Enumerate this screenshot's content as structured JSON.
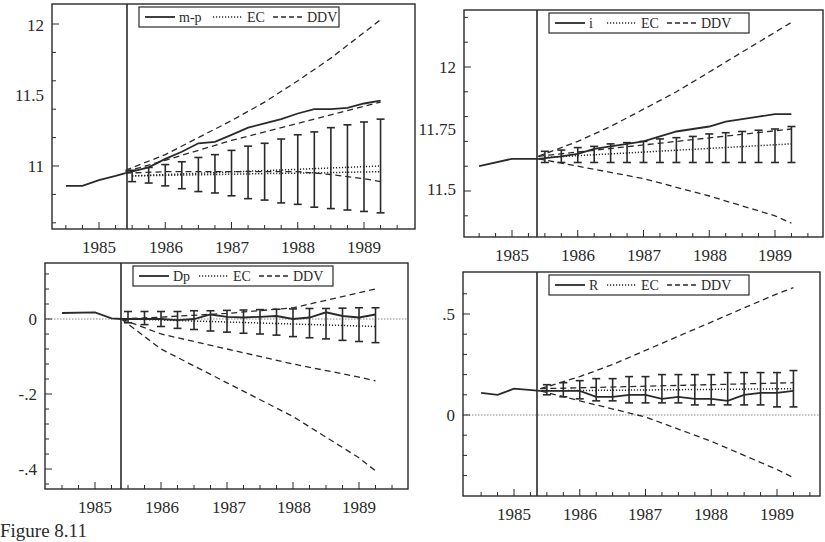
{
  "figure": {
    "caption": "Figure 8.11"
  },
  "chart_data": [
    {
      "type": "line",
      "title": "m-p",
      "legend": [
        "m-p",
        "EC",
        "DDV"
      ],
      "legend_position": "top-center",
      "x_ticks": [
        "1985",
        "1986",
        "1987",
        "1988",
        "1989"
      ],
      "y_ticks": [
        "11",
        "11.5",
        "12"
      ],
      "ylim": [
        10.6,
        12.15
      ],
      "forecast_origin": 1985.4,
      "history": {
        "x": [
          1984.5,
          1984.75,
          1985.0,
          1985.25,
          1985.4
        ],
        "y": [
          10.86,
          10.86,
          10.9,
          10.93,
          10.95
        ]
      },
      "series": [
        {
          "name": "m-p",
          "style": "solid",
          "x": [
            1985.4,
            1985.75,
            1986.0,
            1986.25,
            1986.5,
            1986.75,
            1987.0,
            1987.25,
            1987.5,
            1987.75,
            1988.0,
            1988.25,
            1988.5,
            1988.75,
            1989.0,
            1989.25
          ],
          "y": [
            10.95,
            10.99,
            11.05,
            11.1,
            11.16,
            11.17,
            11.22,
            11.27,
            11.3,
            11.33,
            11.37,
            11.4,
            11.4,
            11.41,
            11.44,
            11.46
          ]
        },
        {
          "name": "EC",
          "style": "dotted",
          "x": [
            1985.5,
            1989.25
          ],
          "y": [
            10.93,
            11.0
          ]
        },
        {
          "name": "EC-lower",
          "style": "dotted",
          "x": [
            1985.5,
            1989.25
          ],
          "y": [
            10.93,
            10.96
          ]
        },
        {
          "name": "DDV-upper",
          "style": "dashed",
          "x": [
            1985.4,
            1986.0,
            1986.5,
            1987.0,
            1987.5,
            1988.0,
            1988.5,
            1989.0,
            1989.25
          ],
          "y": [
            10.97,
            11.08,
            11.2,
            11.32,
            11.45,
            11.6,
            11.76,
            11.94,
            12.03
          ]
        },
        {
          "name": "DDV-mid",
          "style": "dashed",
          "x": [
            1985.4,
            1986.0,
            1987.0,
            1988.0,
            1989.0,
            1989.25
          ],
          "y": [
            10.96,
            11.04,
            11.18,
            11.3,
            11.42,
            11.45
          ]
        },
        {
          "name": "DDV-lower",
          "style": "dashed",
          "x": [
            1985.4,
            1986.0,
            1987.0,
            1988.0,
            1988.5,
            1989.0,
            1989.25
          ],
          "y": [
            10.95,
            10.96,
            10.96,
            10.96,
            10.94,
            10.91,
            10.89
          ]
        }
      ],
      "error_bars": {
        "x": [
          1985.5,
          1985.75,
          1986.0,
          1986.25,
          1986.5,
          1986.75,
          1987.0,
          1987.25,
          1987.5,
          1987.75,
          1988.0,
          1988.25,
          1988.5,
          1988.75,
          1989.0,
          1989.25
        ],
        "center": [
          10.93,
          10.93,
          10.935,
          10.94,
          10.94,
          10.945,
          10.95,
          10.955,
          10.96,
          10.965,
          10.97,
          10.975,
          10.98,
          10.985,
          10.99,
          11.0
        ],
        "low": [
          10.89,
          10.88,
          10.86,
          10.84,
          10.82,
          10.81,
          10.79,
          10.77,
          10.76,
          10.74,
          10.73,
          10.71,
          10.7,
          10.69,
          10.68,
          10.67
        ],
        "high": [
          10.97,
          10.99,
          11.01,
          11.03,
          11.06,
          11.08,
          11.11,
          11.14,
          11.16,
          11.19,
          11.22,
          11.24,
          11.27,
          11.29,
          11.31,
          11.33
        ]
      },
      "frame": {
        "x0": 52,
        "x1": 415,
        "y0": 4,
        "y1": 229,
        "vline": 127
      },
      "x_px": {
        "1985": 99,
        "1986": 166,
        "1987": 232,
        "1988": 298,
        "1989": 364
      },
      "y_px": {
        "11": 166,
        "11.5": 95,
        "12": 25
      }
    },
    {
      "type": "line",
      "title": "i",
      "legend": [
        "i",
        "EC",
        "DDV"
      ],
      "legend_position": "top-center",
      "x_ticks": [
        "1985",
        "1986",
        "1987",
        "1988",
        "1989"
      ],
      "y_ticks": [
        "11.5",
        "11.75",
        "12"
      ],
      "ylim": [
        11.35,
        12.2
      ],
      "forecast_origin": 1985.4,
      "history": {
        "x": [
          1984.5,
          1985.0,
          1985.4
        ],
        "y": [
          11.6,
          11.63,
          11.63
        ]
      },
      "series": [
        {
          "name": "i",
          "style": "solid",
          "x": [
            1985.4,
            1985.75,
            1986.0,
            1986.25,
            1986.5,
            1986.75,
            1987.0,
            1987.25,
            1987.5,
            1987.75,
            1988.0,
            1988.25,
            1988.5,
            1988.75,
            1989.0,
            1989.25
          ],
          "y": [
            11.63,
            11.64,
            11.65,
            11.67,
            11.68,
            11.69,
            11.7,
            11.72,
            11.74,
            11.75,
            11.76,
            11.78,
            11.79,
            11.8,
            11.81,
            11.81
          ]
        },
        {
          "name": "EC",
          "style": "dotted",
          "x": [
            1985.5,
            1989.25
          ],
          "y": [
            11.635,
            11.69
          ]
        },
        {
          "name": "DDV-upper",
          "style": "dashed",
          "x": [
            1985.4,
            1986.0,
            1986.5,
            1987.0,
            1987.5,
            1988.0,
            1988.5,
            1989.0,
            1989.25
          ],
          "y": [
            11.64,
            11.7,
            11.76,
            11.83,
            11.9,
            11.98,
            12.06,
            12.14,
            12.18
          ]
        },
        {
          "name": "DDV-mid",
          "style": "dashed",
          "x": [
            1985.4,
            1989.25
          ],
          "y": [
            11.64,
            11.75
          ]
        },
        {
          "name": "DDV-lower",
          "style": "dashed",
          "x": [
            1985.4,
            1986.0,
            1987.0,
            1988.0,
            1989.0,
            1989.25
          ],
          "y": [
            11.63,
            11.6,
            11.55,
            11.48,
            11.4,
            11.37
          ]
        }
      ],
      "error_bars": {
        "x": [
          1985.5,
          1985.75,
          1986.0,
          1986.25,
          1986.5,
          1986.75,
          1987.0,
          1987.25,
          1987.5,
          1987.75,
          1988.0,
          1988.25,
          1988.5,
          1988.75,
          1989.0,
          1989.25
        ],
        "center": [
          11.635,
          11.64,
          11.645,
          11.65,
          11.655,
          11.66,
          11.665,
          11.67,
          11.67,
          11.675,
          11.68,
          11.68,
          11.685,
          11.685,
          11.69,
          11.69
        ],
        "low": [
          11.615,
          11.615,
          11.615,
          11.615,
          11.615,
          11.615,
          11.615,
          11.615,
          11.615,
          11.615,
          11.615,
          11.615,
          11.615,
          11.615,
          11.615,
          11.615
        ],
        "high": [
          11.66,
          11.665,
          11.675,
          11.68,
          11.69,
          11.695,
          11.7,
          11.71,
          11.715,
          11.72,
          11.73,
          11.735,
          11.74,
          11.745,
          11.75,
          11.76
        ]
      },
      "frame": {
        "x0": 464,
        "x1": 823,
        "y0": 10,
        "y1": 237,
        "vline": 537
      },
      "x_px": {
        "1985": 512,
        "1986": 578,
        "1987": 644,
        "1988": 710,
        "1989": 775
      },
      "y_px": {
        "11.5": 189,
        "11.75": 129,
        "12": 67
      }
    },
    {
      "type": "line",
      "title": "Dp",
      "legend": [
        "Dp",
        "EC",
        "DDV"
      ],
      "legend_position": "top-center",
      "x_ticks": [
        "1985",
        "1986",
        "1987",
        "1988",
        "1989"
      ],
      "y_ticks": [
        "-.4",
        "-.2",
        "0"
      ],
      "ylim": [
        -0.45,
        0.15
      ],
      "forecast_origin": 1985.4,
      "zero_line": true,
      "history": {
        "x": [
          1984.5,
          1985.0,
          1985.25,
          1985.4
        ],
        "y": [
          0.016,
          0.018,
          0.002,
          0.0
        ]
      },
      "series": [
        {
          "name": "Dp",
          "style": "solid",
          "x": [
            1985.4,
            1985.75,
            1986.0,
            1986.25,
            1986.5,
            1986.75,
            1987.0,
            1987.25,
            1987.5,
            1987.75,
            1988.0,
            1988.25,
            1988.5,
            1988.75,
            1989.0,
            1989.25
          ],
          "y": [
            0.0,
            0.0,
            0.0,
            -0.003,
            0.0,
            0.012,
            0.006,
            0.004,
            0.006,
            0.008,
            0.0,
            0.004,
            0.018,
            0.008,
            0.004,
            0.012
          ]
        },
        {
          "name": "EC",
          "style": "dotted",
          "x": [
            1985.5,
            1989.25
          ],
          "y": [
            0.0,
            -0.02
          ]
        },
        {
          "name": "DDV-upper",
          "style": "dashed",
          "x": [
            1985.4,
            1986.0,
            1987.0,
            1988.0,
            1989.0,
            1989.25
          ],
          "y": [
            0.0,
            0.005,
            0.015,
            0.03,
            0.07,
            0.08
          ]
        },
        {
          "name": "DDV-mid",
          "style": "dashed",
          "x": [
            1985.4,
            1986.0,
            1987.0,
            1988.0,
            1989.0,
            1989.25
          ],
          "y": [
            0.0,
            -0.04,
            -0.08,
            -0.12,
            -0.155,
            -0.165
          ]
        },
        {
          "name": "DDV-lower",
          "style": "dashed",
          "x": [
            1985.4,
            1986.0,
            1987.0,
            1988.0,
            1989.0,
            1989.25
          ],
          "y": [
            0.0,
            -0.08,
            -0.17,
            -0.26,
            -0.37,
            -0.405
          ]
        }
      ],
      "error_bars": {
        "x": [
          1985.5,
          1985.75,
          1986.0,
          1986.25,
          1986.5,
          1986.75,
          1987.0,
          1987.25,
          1987.5,
          1987.75,
          1988.0,
          1988.25,
          1988.5,
          1988.75,
          1989.0,
          1989.25
        ],
        "center": [
          0.0,
          -0.002,
          -0.003,
          -0.004,
          -0.005,
          -0.006,
          -0.007,
          -0.008,
          -0.009,
          -0.01,
          -0.011,
          -0.012,
          -0.013,
          -0.014,
          -0.015,
          -0.016
        ],
        "low": [
          -0.01,
          -0.015,
          -0.02,
          -0.025,
          -0.028,
          -0.032,
          -0.035,
          -0.038,
          -0.04,
          -0.043,
          -0.047,
          -0.05,
          -0.053,
          -0.057,
          -0.06,
          -0.063
        ],
        "high": [
          0.02,
          0.02,
          0.02,
          0.02,
          0.022,
          0.022,
          0.023,
          0.024,
          0.025,
          0.026,
          0.027,
          0.028,
          0.028,
          0.029,
          0.03,
          0.03
        ]
      },
      "frame": {
        "x0": 45,
        "x1": 408,
        "y0": 263,
        "y1": 489,
        "vline": 121
      },
      "x_px": {
        "1985": 95,
        "1986": 162,
        "1987": 229,
        "1988": 294,
        "1989": 359
      },
      "y_px": {
        "0": 319,
        "-.2": 394,
        "-.4": 469
      }
    },
    {
      "type": "line",
      "title": "R",
      "legend": [
        "R",
        "EC",
        "DDV"
      ],
      "legend_position": "top-center",
      "x_ticks": [
        "1985",
        "1986",
        "1987",
        "1988",
        "1989"
      ],
      "y_ticks": [
        "0",
        ".5"
      ],
      "ylim": [
        -0.4,
        0.75
      ],
      "forecast_origin": 1985.4,
      "zero_line": true,
      "history": {
        "x": [
          1984.5,
          1984.75,
          1985.0,
          1985.4
        ],
        "y": [
          0.11,
          0.1,
          0.13,
          0.12
        ]
      },
      "series": [
        {
          "name": "R",
          "style": "solid",
          "x": [
            1985.4,
            1985.75,
            1986.0,
            1986.25,
            1986.5,
            1986.75,
            1987.0,
            1987.25,
            1987.5,
            1987.75,
            1988.0,
            1988.25,
            1988.5,
            1988.75,
            1989.0,
            1989.25
          ],
          "y": [
            0.12,
            0.12,
            0.12,
            0.09,
            0.09,
            0.1,
            0.1,
            0.08,
            0.09,
            0.08,
            0.08,
            0.07,
            0.1,
            0.11,
            0.11,
            0.12
          ]
        },
        {
          "name": "EC",
          "style": "dotted",
          "x": [
            1985.5,
            1989.25
          ],
          "y": [
            0.12,
            0.13
          ]
        },
        {
          "name": "DDV-upper",
          "style": "dashed",
          "x": [
            1985.4,
            1986.0,
            1986.5,
            1987.0,
            1987.5,
            1988.0,
            1988.5,
            1989.0,
            1989.25
          ],
          "y": [
            0.13,
            0.19,
            0.25,
            0.32,
            0.39,
            0.46,
            0.53,
            0.6,
            0.63
          ]
        },
        {
          "name": "DDV-mid",
          "style": "dashed",
          "x": [
            1985.4,
            1989.25
          ],
          "y": [
            0.13,
            0.16
          ]
        },
        {
          "name": "DDV-lower",
          "style": "dashed",
          "x": [
            1985.4,
            1986.0,
            1987.0,
            1988.0,
            1989.0,
            1989.25
          ],
          "y": [
            0.12,
            0.07,
            -0.01,
            -0.13,
            -0.27,
            -0.31
          ]
        }
      ],
      "error_bars": {
        "x": [
          1985.5,
          1985.75,
          1986.0,
          1986.25,
          1986.5,
          1986.75,
          1987.0,
          1987.25,
          1987.5,
          1987.75,
          1988.0,
          1988.25,
          1988.5,
          1988.75,
          1989.0,
          1989.25
        ],
        "center": [
          0.12,
          0.12,
          0.125,
          0.125,
          0.125,
          0.125,
          0.125,
          0.125,
          0.125,
          0.125,
          0.125,
          0.125,
          0.125,
          0.125,
          0.125,
          0.125
        ],
        "low": [
          0.1,
          0.09,
          0.08,
          0.07,
          0.07,
          0.06,
          0.06,
          0.06,
          0.06,
          0.05,
          0.05,
          0.05,
          0.05,
          0.05,
          0.04,
          0.04
        ],
        "high": [
          0.15,
          0.16,
          0.17,
          0.18,
          0.18,
          0.19,
          0.19,
          0.2,
          0.2,
          0.2,
          0.2,
          0.21,
          0.21,
          0.21,
          0.21,
          0.22
        ]
      },
      "frame": {
        "x0": 463,
        "x1": 820,
        "y0": 272,
        "y1": 496,
        "vline": 537
      },
      "x_px": {
        "1985": 514,
        "1986": 580,
        "1987": 645,
        "1988": 711,
        "1989": 777
      },
      "y_px": {
        "0": 415,
        ".5": 314
      }
    }
  ]
}
